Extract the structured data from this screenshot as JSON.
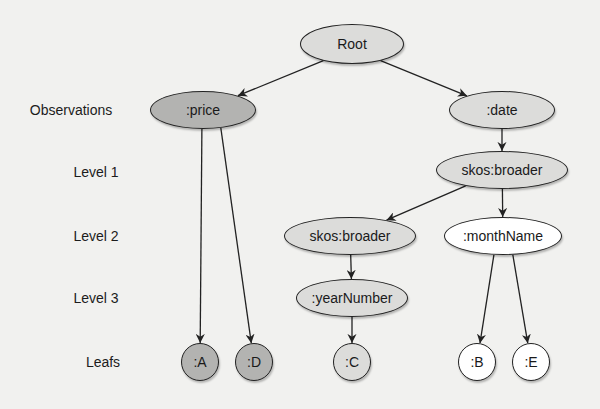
{
  "diagram": {
    "type": "tree",
    "colors": {
      "background": "#f1f1ef",
      "dark_fill": "#b3b3b1",
      "light_fill": "#dcdcda",
      "white_fill": "#ffffff",
      "stroke": "#222222"
    },
    "level_labels": [
      {
        "id": "observations",
        "text": "Observations",
        "x": 71,
        "y": 110
      },
      {
        "id": "level1",
        "text": "Level 1",
        "x": 96,
        "y": 172
      },
      {
        "id": "level2",
        "text": "Level 2",
        "x": 96,
        "y": 236
      },
      {
        "id": "level3",
        "text": "Level 3",
        "x": 96,
        "y": 298
      },
      {
        "id": "leafs",
        "text": "Leafs",
        "x": 103,
        "y": 362
      }
    ],
    "nodes": [
      {
        "id": "root",
        "label": "Root",
        "cx": 352,
        "cy": 44,
        "rx": 52,
        "ry": 20,
        "fill": "light"
      },
      {
        "id": "price",
        "label": ":price",
        "cx": 203,
        "cy": 110,
        "rx": 53,
        "ry": 19,
        "fill": "dark"
      },
      {
        "id": "date",
        "label": ":date",
        "cx": 502,
        "cy": 110,
        "rx": 53,
        "ry": 19,
        "fill": "light"
      },
      {
        "id": "broader1",
        "label": "skos:broader",
        "cx": 502,
        "cy": 170,
        "rx": 66,
        "ry": 19,
        "fill": "light"
      },
      {
        "id": "broader2",
        "label": "skos:broader",
        "cx": 350,
        "cy": 236,
        "rx": 66,
        "ry": 19,
        "fill": "light"
      },
      {
        "id": "monthName",
        "label": ":monthName",
        "cx": 503,
        "cy": 236,
        "rx": 59,
        "ry": 19,
        "fill": "white"
      },
      {
        "id": "yearNumber",
        "label": ":yearNumber",
        "cx": 352,
        "cy": 298,
        "rx": 56,
        "ry": 19,
        "fill": "light"
      },
      {
        "id": "A",
        "label": ":A",
        "cx": 200,
        "cy": 362,
        "rx": 19,
        "ry": 19,
        "fill": "dark"
      },
      {
        "id": "D",
        "label": ":D",
        "cx": 254,
        "cy": 362,
        "rx": 19,
        "ry": 19,
        "fill": "dark"
      },
      {
        "id": "C",
        "label": ":C",
        "cx": 352,
        "cy": 362,
        "rx": 19,
        "ry": 19,
        "fill": "light"
      },
      {
        "id": "B",
        "label": ":B",
        "cx": 477,
        "cy": 362,
        "rx": 19,
        "ry": 19,
        "fill": "white"
      },
      {
        "id": "E",
        "label": ":E",
        "cx": 531,
        "cy": 362,
        "rx": 19,
        "ry": 19,
        "fill": "white"
      }
    ],
    "edges": [
      {
        "from": "root",
        "to": "price"
      },
      {
        "from": "root",
        "to": "date"
      },
      {
        "from": "price",
        "to": "A"
      },
      {
        "from": "price",
        "to": "D"
      },
      {
        "from": "date",
        "to": "broader1"
      },
      {
        "from": "broader1",
        "to": "broader2"
      },
      {
        "from": "broader1",
        "to": "monthName"
      },
      {
        "from": "broader2",
        "to": "yearNumber"
      },
      {
        "from": "yearNumber",
        "to": "C"
      },
      {
        "from": "monthName",
        "to": "B"
      },
      {
        "from": "monthName",
        "to": "E"
      }
    ]
  }
}
